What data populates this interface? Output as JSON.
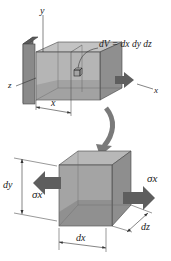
{
  "figure": {
    "top_panel": {
      "axes": {
        "y_label": "y",
        "z_label": "z",
        "x_label": "x"
      },
      "volume_element_label": "dV = dx dy dz",
      "position_dimension_label": "x"
    },
    "bottom_panel": {
      "dimension_labels": {
        "height": "dy",
        "width": "dx",
        "depth": "dz"
      },
      "stress_labels": {
        "left": "σx",
        "right": "σx"
      }
    }
  },
  "colors": {
    "background": "#ffffff",
    "wall_front": "#8a8a8a",
    "wall_top": "#6f6f6f",
    "beam_front": "#a8a8a8",
    "beam_top": "#bdbdbd",
    "beam_side": "#9a9a9a",
    "cube_front": "#9c9c9c",
    "cube_top": "#b8b8b8",
    "cube_side": "#8e8e8e",
    "arrow": "#5e5e5e",
    "curved_arrow": "#7a7a7a",
    "line": "#333333"
  }
}
